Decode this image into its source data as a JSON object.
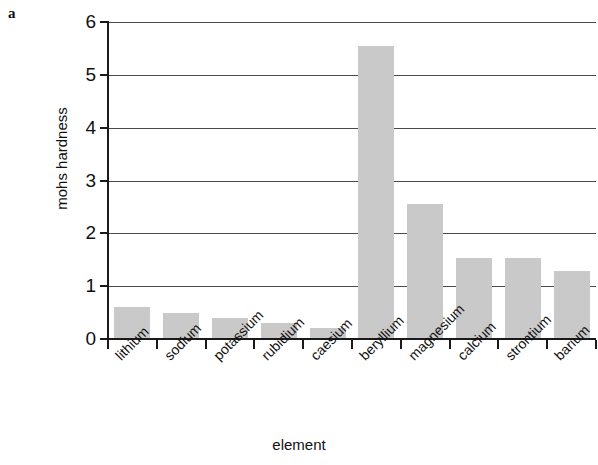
{
  "panel": {
    "label": "a"
  },
  "chart_data": {
    "type": "bar",
    "title": "",
    "xlabel": "element",
    "ylabel": "mohs hardness",
    "categories": [
      "lithium",
      "sodium",
      "potassium",
      "rubidium",
      "caesium",
      "beryllium",
      "magnesium",
      "calcium",
      "strontium",
      "barium"
    ],
    "values": [
      0.6,
      0.5,
      0.4,
      0.3,
      0.2,
      5.55,
      2.55,
      1.53,
      1.53,
      1.28
    ],
    "ylim": [
      0,
      6
    ],
    "yticks": [
      "0",
      "1",
      "2",
      "3",
      "4",
      "5",
      "6"
    ],
    "ytick_values": [
      0,
      1,
      2,
      3,
      4,
      5,
      6
    ],
    "grid": "horizontal",
    "legend": "none",
    "bar_color": "#c9c9c9",
    "axis_color": "#1a1a1a"
  }
}
